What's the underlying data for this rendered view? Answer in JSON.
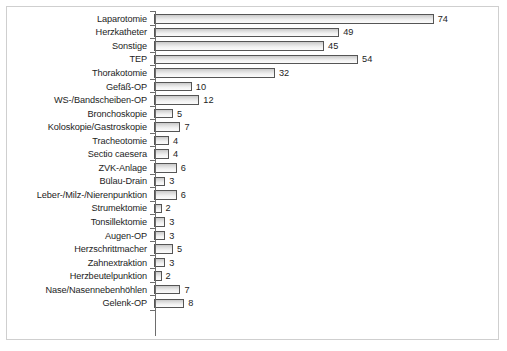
{
  "chart_data": {
    "type": "bar",
    "orientation": "horizontal",
    "title": "",
    "subtitle": "",
    "xlabel": "",
    "ylabel": "",
    "grid": false,
    "legend": null,
    "xlim": [
      0,
      74
    ],
    "axis_max_for_scale": 74,
    "categories": [
      "Laparotomie",
      "Herzkatheter",
      "Sonstige",
      "TEP",
      "Thorakotomie",
      "Gefäß-OP",
      "WS-/Bandscheiben-OP",
      "Bronchoskopie",
      "Koloskopie/Gastroskopie",
      "Tracheotomie",
      "Sectio caesera",
      "ZVK-Anlage",
      "Bülau-Drain",
      "Leber-/Milz-/Nierenpunktion",
      "Strumektomie",
      "Tonsillektomie",
      "Augen-OP",
      "Herzschrittmacher",
      "Zahnextraktion",
      "Herzbeutelpunktion",
      "Nase/Nasennebenhöhlen",
      "Gelenk-OP"
    ],
    "values": [
      74,
      49,
      45,
      54,
      32,
      10,
      12,
      5,
      7,
      4,
      4,
      6,
      3,
      6,
      2,
      3,
      3,
      5,
      3,
      2,
      7,
      8
    ],
    "value_labels": [
      "74",
      "49",
      "45",
      "54",
      "32",
      "10",
      "12",
      "5",
      "7",
      "4",
      "4",
      "6",
      "3",
      "6",
      "2",
      "3",
      "3",
      "5",
      "3",
      "2",
      "7",
      "8"
    ],
    "colors": {
      "bar_fill_top": "#c8c8c8",
      "bar_fill_bottom": "#fbfbfb",
      "bar_border": "#555555",
      "axis": "#6d6d6d",
      "frame_border": "#cfcfcf",
      "background": "#ffffff",
      "text": "#1d1d1d"
    }
  }
}
